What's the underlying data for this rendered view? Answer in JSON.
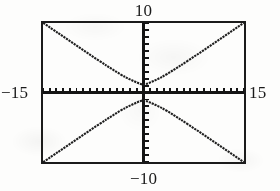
{
  "figure": {
    "kind": "graphing-calculator-viewing-window",
    "frame_color": "#1b1b1b",
    "curve_color": "#1f1f1f",
    "axis_color": "#141414",
    "background_color": "#fdfdfc"
  },
  "window_labels": {
    "ymax": "10",
    "ymin": "−10",
    "xmin": "−15",
    "xmax": "15"
  },
  "chart_data": {
    "type": "line",
    "title": "",
    "xlabel": "",
    "ylabel": "",
    "grid": false,
    "legend": "none",
    "xlim": [
      -15,
      15
    ],
    "ylim": [
      -10,
      10
    ],
    "x_tick_step": 1,
    "y_tick_step": 1,
    "axes": {
      "x_axis_y": 0,
      "y_axis_x": 0,
      "tick_marks": true,
      "tick_length_px": 5
    },
    "annotations": [
      {
        "text": "10",
        "position": "above-top-center",
        "meaning": "Ymax"
      },
      {
        "text": "−10",
        "position": "below-bottom-center",
        "meaning": "Ymin"
      },
      {
        "text": "−15",
        "position": "left-of-frame-middle",
        "meaning": "Xmin"
      },
      {
        "text": "15",
        "position": "right-of-frame-middle",
        "meaning": "Xmax"
      }
    ],
    "series": [
      {
        "name": "upper branch",
        "comment": "Hyperbola branch opening upward, vertex near (0, 1.1), asymptotic to y = ±(2/3)x",
        "x": [
          -15,
          -13.5,
          -12,
          -10.5,
          -9,
          -7.5,
          -6,
          -5,
          -4,
          -3,
          -2.4,
          -1.8,
          -1.2,
          -0.6,
          0,
          0.6,
          1.2,
          1.8,
          2.4,
          3,
          4,
          5,
          6,
          7.5,
          9,
          10.5,
          12,
          13.5,
          15
        ],
        "y": [
          10.04,
          9.05,
          8.06,
          7.08,
          6.1,
          5.13,
          4.17,
          3.55,
          2.94,
          2.37,
          2.06,
          1.79,
          1.53,
          1.27,
          1.1,
          1.27,
          1.53,
          1.79,
          2.06,
          2.37,
          2.94,
          3.55,
          4.17,
          5.13,
          6.1,
          7.08,
          8.06,
          9.05,
          10.04
        ]
      },
      {
        "name": "lower branch",
        "comment": "Hyperbola branch opening downward, vertex near (0, -1.1), asymptotic to y = ±(2/3)x",
        "x": [
          -15,
          -13.5,
          -12,
          -10.5,
          -9,
          -7.5,
          -6,
          -5,
          -4,
          -3,
          -2.4,
          -1.8,
          -1.2,
          -0.6,
          0,
          0.6,
          1.2,
          1.8,
          2.4,
          3,
          4,
          5,
          6,
          7.5,
          9,
          10.5,
          12,
          13.5,
          15
        ],
        "y": [
          -10.04,
          -9.05,
          -8.06,
          -7.08,
          -6.1,
          -5.13,
          -4.17,
          -3.55,
          -2.94,
          -2.37,
          -2.06,
          -1.79,
          -1.53,
          -1.27,
          -1.1,
          -1.27,
          -1.53,
          -1.79,
          -2.06,
          -2.37,
          -2.94,
          -3.55,
          -4.17,
          -5.13,
          -6.1,
          -7.08,
          -8.06,
          -9.05,
          -10.04
        ]
      }
    ]
  }
}
